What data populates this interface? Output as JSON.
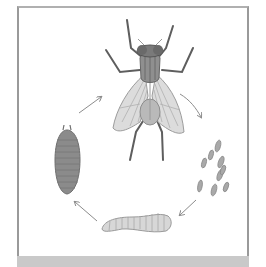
{
  "diagram": {
    "title": "",
    "stages": [
      {
        "name": "adult-fly",
        "label": ""
      },
      {
        "name": "eggs",
        "label": ""
      },
      {
        "name": "larva",
        "label": ""
      },
      {
        "name": "pupa",
        "label": ""
      }
    ],
    "arrows": [
      {
        "from": "adult-fly",
        "to": "eggs"
      },
      {
        "from": "eggs",
        "to": "larva"
      },
      {
        "from": "larva",
        "to": "pupa"
      },
      {
        "from": "pupa",
        "to": "adult-fly"
      }
    ],
    "colors": {
      "border": "#9a9a9a",
      "band": "#c9c9c9",
      "body_dark": "#6e6e6e",
      "wing": "#d9d9d9",
      "pupa": "#8a8a8a",
      "larva": "#d4d4d4",
      "eggs": "#a8a8a8",
      "arrow": "#8c8c8c"
    }
  }
}
